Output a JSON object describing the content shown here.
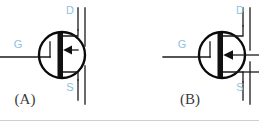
{
  "figure": {
    "type": "circuit-symbol-figure",
    "background_color": "#ffffff",
    "terminal_label_color": "#8fbfe0",
    "line_color": "#111111",
    "panel_label_color": "#3b3b3b"
  },
  "panels": [
    {
      "id": "A",
      "caption": "(A)",
      "caption_x": 25,
      "caption_y": 101,
      "circle": {
        "cx": 62,
        "cy": 55,
        "r": 23
      },
      "terminals": [
        {
          "name": "drain",
          "label": "D",
          "label_x": 70,
          "label_y": 11
        },
        {
          "name": "gate",
          "label": "G",
          "label_x": 18,
          "label_y": 45
        },
        {
          "name": "source",
          "label": "S",
          "label_x": 70,
          "label_y": 88
        }
      ],
      "arrow_direction": "left",
      "arrow_y": 50,
      "rail_x": 85,
      "gate_lead_y": 57
    },
    {
      "id": "B",
      "caption": "(B)",
      "caption_x": 190,
      "caption_y": 101,
      "circle": {
        "cx": 222,
        "cy": 55,
        "r": 23
      },
      "terminals": [
        {
          "name": "drain",
          "label": "D",
          "label_x": 240,
          "label_y": 11
        },
        {
          "name": "gate",
          "label": "G",
          "label_x": 182,
          "label_y": 45
        },
        {
          "name": "source",
          "label": "S",
          "label_x": 240,
          "label_y": 88
        }
      ],
      "arrow_direction": "left",
      "arrow_y": 55,
      "rail_x": 250,
      "gate_lead_y": 57
    }
  ],
  "labels": {
    "panel_a_caption": "(A)",
    "panel_b_caption": "(B)",
    "a_drain": "D",
    "a_gate": "G",
    "a_source": "S",
    "b_drain": "D",
    "b_gate": "G",
    "b_source": "S"
  }
}
